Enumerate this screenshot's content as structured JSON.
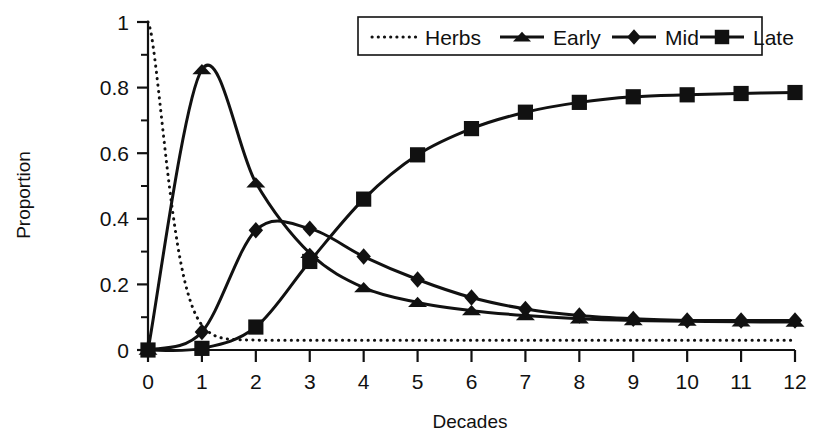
{
  "chart_data": {
    "type": "line",
    "title": "",
    "xlabel": "Decades",
    "ylabel": "Proportion",
    "xlim": [
      0,
      12
    ],
    "ylim": [
      0,
      1
    ],
    "grid": false,
    "legend_position": "top-right",
    "x": [
      0,
      1,
      2,
      3,
      4,
      5,
      6,
      7,
      8,
      9,
      10,
      11,
      12
    ],
    "xticklabels": [
      "0",
      "1",
      "2",
      "3",
      "4",
      "5",
      "6",
      "7",
      "8",
      "9",
      "10",
      "11",
      "12"
    ],
    "yticklabels": [
      "0",
      "0.2",
      "0.4",
      "0.6",
      "0.8",
      "1"
    ],
    "ytickvalues": [
      0,
      0.2,
      0.4,
      0.6,
      0.8,
      1
    ],
    "yminorticks": [
      0.1,
      0.3,
      0.5,
      0.7,
      0.9
    ],
    "series": [
      {
        "name": "Herbs",
        "marker": "none",
        "linestyle": "dotted",
        "color": "#111111",
        "values": [
          1.0,
          0.33,
          0.035,
          0.03,
          0.03,
          0.03,
          0.03,
          0.03,
          0.03,
          0.03,
          0.03,
          0.03,
          0.03
        ],
        "note": "steep decline from 1.0; flat tail near 0.03"
      },
      {
        "name": "Early",
        "marker": "triangle",
        "linestyle": "solid",
        "color": "#111111",
        "values": [
          0.0,
          0.855,
          0.51,
          0.295,
          0.19,
          0.145,
          0.12,
          0.105,
          0.095,
          0.09,
          0.088,
          0.086,
          0.085
        ]
      },
      {
        "name": "Mid",
        "marker": "diamond",
        "linestyle": "solid",
        "color": "#111111",
        "values": [
          0.0,
          0.055,
          0.365,
          0.37,
          0.285,
          0.215,
          0.16,
          0.125,
          0.105,
          0.095,
          0.09,
          0.09,
          0.09
        ]
      },
      {
        "name": "Late",
        "marker": "square",
        "linestyle": "solid",
        "color": "#111111",
        "values": [
          0.0,
          0.005,
          0.07,
          0.27,
          0.46,
          0.595,
          0.675,
          0.725,
          0.755,
          0.772,
          0.778,
          0.782,
          0.785
        ]
      }
    ]
  },
  "legend": {
    "entries": [
      {
        "label": "Herbs",
        "marker": "none",
        "linestyle": "dotted"
      },
      {
        "label": "Early",
        "marker": "triangle",
        "linestyle": "solid"
      },
      {
        "label": "Mid",
        "marker": "diamond",
        "linestyle": "solid"
      },
      {
        "label": "Late",
        "marker": "square",
        "linestyle": "solid"
      }
    ]
  },
  "axes": {
    "x_title": "Decades",
    "y_title": "Proportion"
  },
  "colors": {
    "ink": "#111111",
    "background": "#ffffff"
  }
}
